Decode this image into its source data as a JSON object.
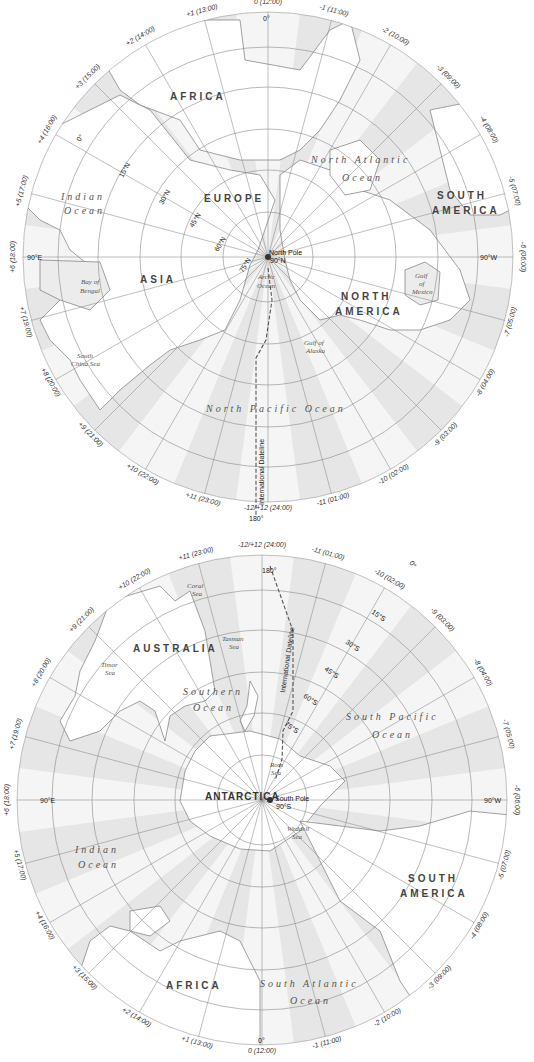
{
  "north_map": {
    "pole_label": "North Pole",
    "pole_deg": "90°N",
    "meridian_top": "0°",
    "meridian_bottom": "180°",
    "meridian_left": "90°E",
    "meridian_right": "90°W",
    "timezone_labels": [
      "0 (12:00)",
      "-1 (11:00)",
      "-2 (10:00)",
      "-3 (09:00)",
      "-4 (08:00)",
      "-5 (07:00)",
      "-6 (06:00)",
      "-7 (05:00)",
      "-8 (04:00)",
      "-9 (03:00)",
      "-10 (02:00)",
      "-11 (01:00)",
      "-12/+12 (24:00)",
      "+11 (23:00)",
      "+10 (22:00)",
      "+9 (21:00)",
      "+8 (20:00)",
      "+7 (19:00)",
      "+6 (18:00)",
      "+5 (17:00)",
      "+4 (16:00)",
      "+3 (15:00)",
      "+2 (14:00)",
      "+1 (13:00)"
    ],
    "extra_zero": "0°",
    "latitudes": [
      "15°N",
      "30°N",
      "45°N",
      "60°N",
      "75°N"
    ],
    "continents": [
      "AFRICA",
      "EUROPE",
      "ASIA",
      "NORTH",
      "AMERICA",
      "SOUTH",
      "AMERICA"
    ],
    "oceans": {
      "indian_1": "Indian",
      "indian_2": "Ocean",
      "north_atlantic_1": "North Atlantic",
      "north_atlantic_2": "Ocean",
      "north_pacific": "North Pacific Ocean",
      "arctic_1": "Arctic",
      "arctic_2": "Ocean"
    },
    "seas": {
      "bay_1": "Bay of",
      "bay_2": "Bengal",
      "scs_1": "South",
      "scs_2": "China Sea",
      "gulf_alaska_1": "Gulf of",
      "gulf_alaska_2": "Alaska",
      "gulf_mexico_1": "Gulf",
      "gulf_mexico_2": "of",
      "gulf_mexico_3": "Mexico"
    },
    "dateline_label": "International Dateline"
  },
  "south_map": {
    "pole_label": "South Pole",
    "pole_deg": "90°S",
    "meridian_top": "180°",
    "meridian_bottom": "0°",
    "meridian_left": "90°E",
    "meridian_right": "90°W",
    "timezone_labels": [
      "-12/+12 (24:00)",
      "-11 (01:00)",
      "-10 (02:00)",
      "-9 (03:00)",
      "-8 (04:00)",
      "-7 (05:00)",
      "-6 (06:00)",
      "-5 (07:00)",
      "-4 (08:00)",
      "-3 (09:00)",
      "-2 (10:00)",
      "-1 (11:00)",
      "0 (12:00)",
      "+1 (13:00)",
      "+2 (14:00)",
      "+3 (15:00)",
      "+4 (16:00)",
      "+5 (17:00)",
      "+6 (18:00)",
      "+7 (19:00)",
      "+8 (20:00)",
      "+9 (21:00)",
      "+10 (22:00)",
      "+11 (23:00)"
    ],
    "extra_zero": "0°",
    "latitudes": [
      "15°S",
      "30°S",
      "45°S",
      "60°S",
      "75°S"
    ],
    "continents": {
      "australia": "AUSTRALIA",
      "antarctica": "ANTARCTICA",
      "africa": "AFRICA",
      "sa_1": "SOUTH",
      "sa_2": "AMERICA"
    },
    "oceans": {
      "southern_1": "Southern",
      "southern_2": "Ocean",
      "south_pacific_1": "South Pacific",
      "south_pacific_2": "Ocean",
      "indian_1": "Indian",
      "indian_2": "Ocean",
      "south_atlantic_1": "South Atlantic",
      "south_atlantic_2": "Ocean"
    },
    "seas": {
      "coral_1": "Coral",
      "coral_2": "Sea",
      "tasman_1": "Tasman",
      "tasman_2": "Sea",
      "timor_1": "Timor",
      "timor_2": "Sea",
      "ross_1": "Ross",
      "ross_2": "Sea",
      "weddell_1": "Weddell",
      "weddell_2": "Sea"
    },
    "dateline_label": "International Dateline"
  },
  "colors": {
    "band_dark": "#e4e4e4",
    "band_light": "#f4f4f4",
    "grid": "#8a8a8a",
    "land": "#ffffff",
    "coast": "#777777",
    "text": "#333333"
  }
}
